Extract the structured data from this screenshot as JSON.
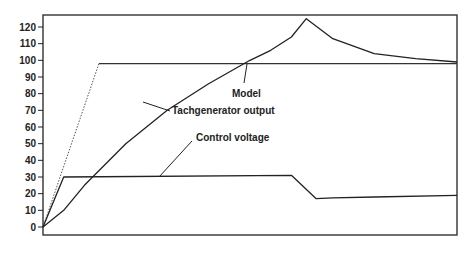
{
  "chart_data": {
    "type": "line",
    "title": "",
    "xlabel": "",
    "ylabel": "",
    "ylim": [
      0,
      120
    ],
    "yticks": [
      0,
      10,
      20,
      30,
      40,
      50,
      60,
      70,
      80,
      90,
      100,
      110,
      120
    ],
    "ytick_labels": [
      "0",
      "10",
      "20",
      "30",
      "40",
      "50",
      "60",
      "70",
      "80",
      "90",
      "100",
      "110",
      "120"
    ],
    "grid": false,
    "legend": "none (inline annotations)",
    "x_units": "relative (0-100, unlabeled axis)",
    "series": [
      {
        "name": "Model",
        "style": "dotted ramp then solid flat",
        "x": [
          0,
          13.5,
          100
        ],
        "values": [
          0,
          98,
          98
        ]
      },
      {
        "name": "Tachgenerator output",
        "style": "solid",
        "x": [
          0,
          5,
          10,
          20,
          30,
          40,
          50,
          55,
          60,
          63.6,
          70,
          80,
          90,
          100
        ],
        "values": [
          0,
          10,
          25,
          50,
          70,
          86,
          100,
          106,
          114,
          125,
          113,
          104,
          101,
          99
        ]
      },
      {
        "name": "Control voltage",
        "style": "solid",
        "x": [
          0,
          5,
          60,
          66,
          70,
          80,
          100
        ],
        "values": [
          0,
          30,
          31,
          17,
          17.5,
          18,
          19
        ]
      }
    ],
    "annotations": [
      {
        "text": "Model",
        "target": "Model"
      },
      {
        "text": "Tachgenerator output",
        "target": "Tachgenerator output"
      },
      {
        "text": "Control voltage",
        "target": "Control voltage"
      }
    ]
  }
}
